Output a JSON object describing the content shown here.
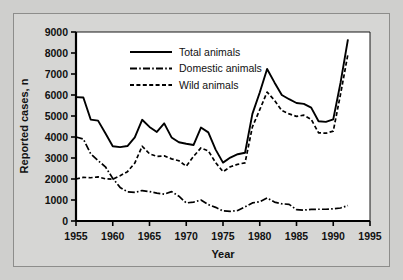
{
  "chart_data": {
    "type": "line",
    "title": "",
    "xlabel": "Year",
    "ylabel": "Reported cases, n",
    "xlim": [
      1955,
      1995
    ],
    "ylim": [
      0,
      9000
    ],
    "xticks": [
      1955,
      1960,
      1965,
      1970,
      1975,
      1980,
      1985,
      1990,
      1995
    ],
    "yticks": [
      0,
      1000,
      2000,
      3000,
      4000,
      5000,
      6000,
      7000,
      8000,
      9000
    ],
    "grid": false,
    "legend_position": "upper-left-inside",
    "x": [
      1955,
      1956,
      1957,
      1958,
      1959,
      1960,
      1961,
      1962,
      1963,
      1964,
      1965,
      1966,
      1967,
      1968,
      1969,
      1970,
      1971,
      1972,
      1973,
      1974,
      1975,
      1976,
      1977,
      1978,
      1979,
      1980,
      1981,
      1982,
      1983,
      1984,
      1985,
      1986,
      1987,
      1988,
      1989,
      1990,
      1991,
      1992
    ],
    "series": [
      {
        "name": "Total animals",
        "style": "solid",
        "values": [
          5900,
          5880,
          4830,
          4780,
          4180,
          3560,
          3520,
          3570,
          3980,
          4820,
          4480,
          4240,
          4650,
          3980,
          3750,
          3680,
          3620,
          4450,
          4220,
          3400,
          2780,
          3020,
          3180,
          3250,
          5100,
          6120,
          7240,
          6600,
          6000,
          5800,
          5620,
          5580,
          5400,
          4750,
          4720,
          4840,
          6600,
          8650
        ]
      },
      {
        "name": "Domestic animals",
        "style": "dash-dot",
        "values": [
          4000,
          3900,
          3200,
          2880,
          2580,
          2030,
          1600,
          1390,
          1360,
          1450,
          1400,
          1330,
          1280,
          1400,
          1180,
          860,
          900,
          1000,
          780,
          650,
          480,
          460,
          500,
          670,
          860,
          920,
          1100,
          900,
          820,
          790,
          540,
          520,
          550,
          560,
          560,
          580,
          620,
          740
        ]
      },
      {
        "name": "Wild animals",
        "style": "dashed",
        "values": [
          2000,
          2080,
          2060,
          2100,
          2010,
          1990,
          2160,
          2350,
          2760,
          3560,
          3200,
          3080,
          3100,
          2960,
          2870,
          2610,
          3080,
          3480,
          3340,
          2780,
          2350,
          2580,
          2700,
          2770,
          4480,
          5300,
          6140,
          5750,
          5260,
          5100,
          4980,
          5040,
          4840,
          4200,
          4180,
          4280,
          6050,
          7950
        ]
      }
    ]
  },
  "legend": {
    "items": [
      {
        "label": "Total animals",
        "style": "solid"
      },
      {
        "label": "Domestic animals",
        "style": "dash-dot"
      },
      {
        "label": "Wild animals",
        "style": "dashed"
      }
    ]
  },
  "axes": {
    "y_label": "Reported cases, n",
    "x_label": "Year",
    "y_tick_labels": [
      "0",
      "1000",
      "2000",
      "3000",
      "4000",
      "5000",
      "6000",
      "7000",
      "8000",
      "9000"
    ],
    "x_tick_labels": [
      "1955",
      "1960",
      "1965",
      "1970",
      "1975",
      "1980",
      "1985",
      "1990",
      "1995"
    ]
  },
  "colors": {
    "line": "#000000",
    "axis": "#000000",
    "plot_background": "#ffffff",
    "figure_background": "#d6d6d4",
    "page_background": "#cfcfcd"
  }
}
